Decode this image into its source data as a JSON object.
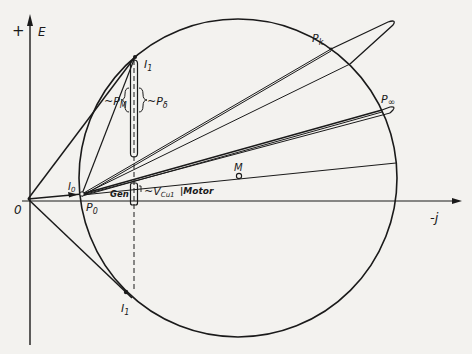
{
  "diagram": {
    "type": "circle-diagram",
    "axes": {
      "vertical_label": "E",
      "vertical_sign": "+",
      "horizontal_label": "-j",
      "origin_label": "0"
    },
    "points": {
      "origin": "0",
      "p0": "P",
      "p0_sub": "0",
      "pk": "P",
      "pk_sub": "k",
      "pinf": "P",
      "pinf_sub": "∞",
      "m": "M",
      "i1_upper": "I",
      "i1_upper_sub": "1",
      "i1_lower": "I",
      "i1_lower_sub": "1",
      "i0": "I",
      "i0_sub": "0"
    },
    "annotations": {
      "pm": "~P",
      "pm_sub": "M",
      "pdelta": "~P",
      "pdelta_sub": "δ",
      "vcu": "~V",
      "vcu_sub": "Cu1",
      "motor": "|Motor",
      "gen": "Gen"
    },
    "colors": {
      "ink": "#1a1a1a",
      "paper": "#f3f2ef"
    }
  }
}
